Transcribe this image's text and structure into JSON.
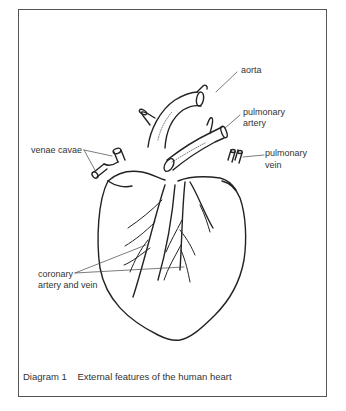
{
  "diagram": {
    "caption_number": "Diagram 1",
    "caption_text": "External features of the human heart",
    "labels": {
      "aorta": "aorta",
      "pulmonary_artery_1": "pulmonary",
      "pulmonary_artery_2": "artery",
      "pulmonary_vein_1": "pulmonary",
      "pulmonary_vein_2": "vein",
      "venae_cavae": "venae cavae",
      "coronary_1": "coronary",
      "coronary_2": "artery and vein"
    }
  }
}
